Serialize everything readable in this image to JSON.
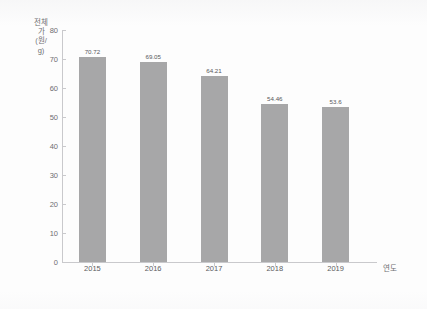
{
  "chart_data": {
    "type": "bar",
    "title": "",
    "subtitle": "",
    "xlabel": "연도",
    "ylabel": "전체가(원/g)",
    "categories": [
      "2015",
      "2016",
      "2017",
      "2018",
      "2019"
    ],
    "values": [
      70.72,
      69.05,
      64.21,
      54.46,
      53.6
    ],
    "value_labels": [
      "70.72",
      "69.05",
      "64.21",
      "54.46",
      "53.6"
    ],
    "ylim": [
      0,
      80
    ],
    "ytick_labels": [
      "0",
      "10",
      "20",
      "30",
      "40",
      "50",
      "60",
      "70",
      "80"
    ],
    "ytick_values": [
      0,
      10,
      20,
      30,
      40,
      50,
      60,
      70,
      80
    ],
    "grid": false,
    "legend": null,
    "legend_position": "none",
    "bar_color": "#a7a7a8",
    "axis_color": "#c9c9cc",
    "text_color": "#6e6e71",
    "background": "#ffffff"
  }
}
